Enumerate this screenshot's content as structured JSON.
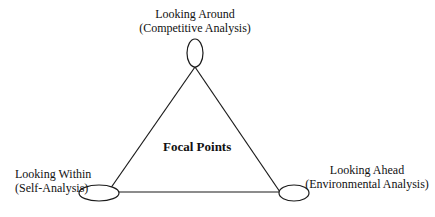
{
  "diagram": {
    "center_label": "Focal Points",
    "nodes": [
      {
        "id": "top",
        "title": "Looking Around",
        "subtitle": "(Competitive Analysis)"
      },
      {
        "id": "left",
        "title": "Looking Within",
        "subtitle": "(Self-Analysis)"
      },
      {
        "id": "right",
        "title": "Looking Ahead",
        "subtitle": "(Environmental Analysis)"
      }
    ],
    "edges": [
      {
        "from": "top",
        "to": "left"
      },
      {
        "from": "top",
        "to": "right"
      },
      {
        "from": "left",
        "to": "right"
      }
    ],
    "colors": {
      "stroke": "#1a1a1a",
      "background": "#ffffff"
    }
  }
}
